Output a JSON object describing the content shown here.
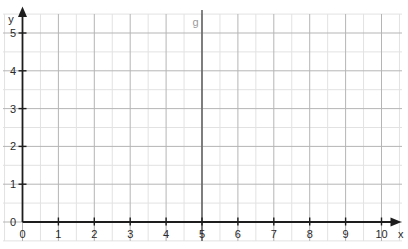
{
  "figure": {
    "x_axis_label": "x",
    "y_axis_label": "y",
    "line_label": "g"
  },
  "chart_data": {
    "type": "line",
    "title": "",
    "xlabel": "x",
    "ylabel": "y",
    "xlim": [
      0,
      10
    ],
    "ylim": [
      0,
      5
    ],
    "x_ticks": [
      0,
      1,
      2,
      3,
      4,
      5,
      6,
      7,
      8,
      9,
      10
    ],
    "y_ticks": [
      0,
      1,
      2,
      3,
      4,
      5
    ],
    "minor_grid_step": 0.5,
    "grid": true,
    "legend": "none",
    "series": [
      {
        "name": "g",
        "type": "vertical_line",
        "x": 5,
        "label": "g"
      }
    ],
    "colors": {
      "axis": "#1d1d1d",
      "major_grid": "#b5b5b5",
      "minor_grid": "#e2e2e2",
      "tick_label": "#2a2a2a",
      "line_g": "#666666",
      "line_g_label": "#9a9a9a",
      "background": "#ffffff"
    }
  }
}
